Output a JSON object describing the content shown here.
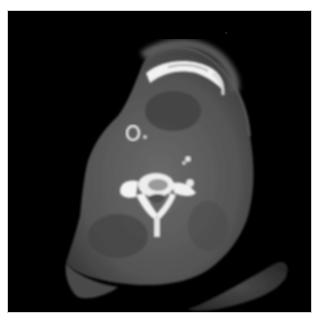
{
  "image": {
    "type": "axial CT scan",
    "subject": "neck cross-section",
    "background_color": "#000000",
    "page_color": "#ffffff",
    "structures": [
      {
        "name": "mandible",
        "appearance": "bright curved bone arc at top"
      },
      {
        "name": "cervical-vertebra",
        "appearance": "bright bony ring at center"
      },
      {
        "name": "airway-ring",
        "appearance": "small bright ring left of center"
      },
      {
        "name": "calcification",
        "appearance": "small bright spots near center-right"
      },
      {
        "name": "soft-tissue",
        "appearance": "grey soft tissue of neck"
      },
      {
        "name": "shoulder",
        "appearance": "grey elongated tissue bottom right"
      }
    ]
  }
}
